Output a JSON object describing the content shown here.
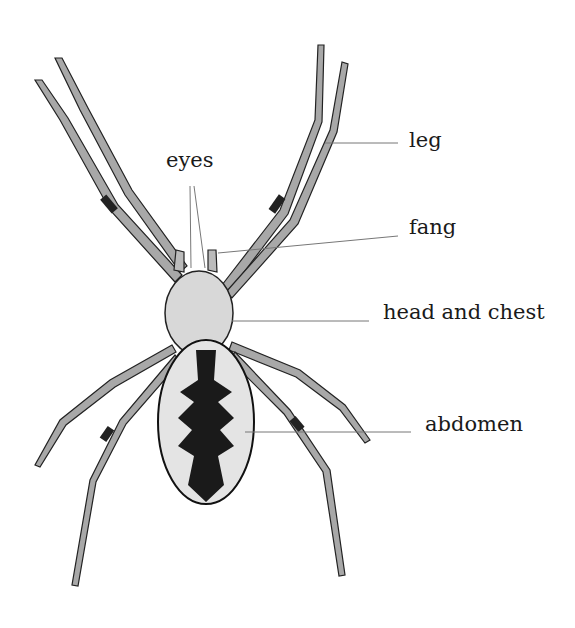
{
  "diagram": {
    "labels": [
      {
        "id": "eyes",
        "text": "eyes",
        "x": 166,
        "y": 150
      },
      {
        "id": "leg",
        "text": "leg",
        "x": 409,
        "y": 130
      },
      {
        "id": "fang",
        "text": "fang",
        "x": 409,
        "y": 217
      },
      {
        "id": "head-and-chest",
        "text": "head and chest",
        "x": 383,
        "y": 302
      },
      {
        "id": "abdomen",
        "text": "abdomen",
        "x": 425,
        "y": 414
      }
    ],
    "colors": {
      "line": "#777777",
      "body_light": "#d8d8d8",
      "body_dark": "#1a1a1a",
      "leg": "#9a9a9a"
    }
  }
}
